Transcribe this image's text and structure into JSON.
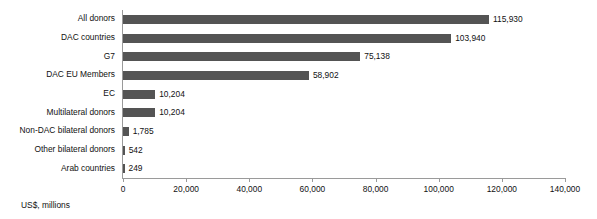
{
  "chart_data": {
    "type": "bar",
    "orientation": "horizontal",
    "title": "",
    "subtitle": "",
    "xlabel": "US$, millions",
    "ylabel": "",
    "xlim": [
      0,
      140000
    ],
    "xticks": [
      0,
      20000,
      40000,
      60000,
      80000,
      100000,
      120000,
      140000
    ],
    "xtick_labels": [
      "0",
      "20,000",
      "40,000",
      "60,000",
      "80,000",
      "100,000",
      "120,000",
      "140,000"
    ],
    "grid": false,
    "legend": false,
    "legend_position": "none",
    "bar_color": "#545454",
    "axis_color": "#9a9a9a",
    "categories": [
      "All donors",
      "DAC countries",
      "G7",
      "DAC EU Members",
      "EC",
      "Multilateral donors",
      "Non-DAC bilateral donors",
      "Other bilateral donors",
      "Arab countries"
    ],
    "values": [
      115930,
      103940,
      75138,
      58902,
      10204,
      10204,
      1785,
      542,
      249
    ],
    "data_labels": [
      "115,930",
      "103,940",
      "75,138",
      "58,902",
      "10,204",
      "10,204",
      "1,785",
      "542",
      "249"
    ]
  }
}
